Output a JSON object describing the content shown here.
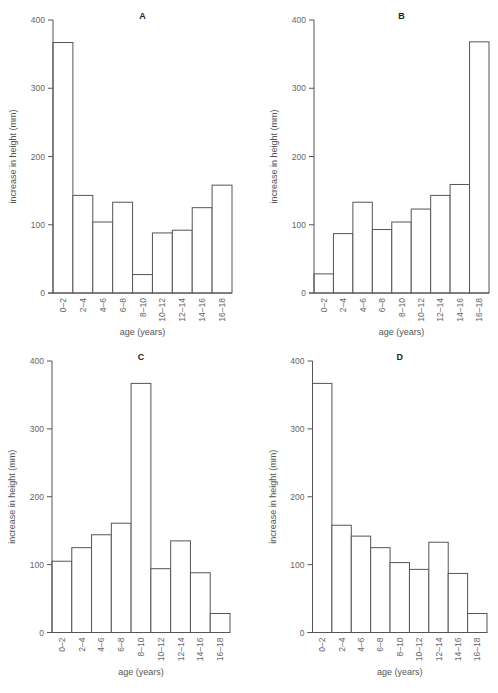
{
  "figure": {
    "background": "#ffffff",
    "line_color": "#555555",
    "bar_fill": "#ffffff"
  },
  "chart_data": [
    {
      "type": "bar",
      "title": "A",
      "xlabel": "age (years)",
      "ylabel": "increase in height (mm)",
      "categories": [
        "0–2",
        "2–4",
        "4–6",
        "6–8",
        "8–10",
        "10–12",
        "12–14",
        "14–16",
        "16–18"
      ],
      "values": [
        367,
        143,
        104,
        133,
        27,
        88,
        92,
        125,
        158
      ],
      "ylim": [
        0,
        400
      ],
      "yticks": [
        0,
        100,
        200,
        300,
        400
      ],
      "grid": false,
      "legend": null,
      "layout": {
        "x0": 53,
        "x1": 232,
        "y0": 293,
        "y400": 20
      }
    },
    {
      "type": "bar",
      "title": "B",
      "xlabel": "age (years)",
      "ylabel": "increase in height (mm)",
      "categories": [
        "0–2",
        "2–4",
        "4–6",
        "6–8",
        "8–10",
        "10–12",
        "12–14",
        "14–16",
        "16–18"
      ],
      "values": [
        28,
        87,
        133,
        93,
        104,
        123,
        143,
        159,
        368
      ],
      "ylim": [
        0,
        400
      ],
      "yticks": [
        0,
        100,
        200,
        300,
        400
      ],
      "grid": false,
      "legend": null,
      "layout": {
        "x0": 314,
        "x1": 489,
        "y0": 293,
        "y400": 20
      }
    },
    {
      "type": "bar",
      "title": "C",
      "xlabel": "age (years)",
      "ylabel": "increase in height (mm)",
      "categories": [
        "0–2",
        "2–4",
        "4–6",
        "6–8",
        "8–10",
        "10–12",
        "12–14",
        "14–16",
        "16–18"
      ],
      "values": [
        105,
        125,
        144,
        161,
        367,
        94,
        135,
        88,
        28
      ],
      "ylim": [
        0,
        400
      ],
      "yticks": [
        0,
        100,
        200,
        300,
        400
      ],
      "grid": false,
      "legend": null,
      "layout": {
        "x0": 52,
        "x1": 230,
        "y0": 632.5,
        "y400": 361
      }
    },
    {
      "type": "bar",
      "title": "D",
      "xlabel": "age (years)",
      "ylabel": "increase in height (mm)",
      "categories": [
        "0–2",
        "2–4",
        "4–6",
        "6–8",
        "8–10",
        "10–12",
        "12–14",
        "14–16",
        "16–18"
      ],
      "values": [
        367,
        158,
        142,
        125,
        103,
        93,
        133,
        87,
        28
      ],
      "ylim": [
        0,
        400
      ],
      "yticks": [
        0,
        100,
        200,
        300,
        400
      ],
      "grid": false,
      "legend": null,
      "layout": {
        "x0": 312.5,
        "x1": 487,
        "y0": 632.5,
        "y400": 361
      }
    }
  ]
}
